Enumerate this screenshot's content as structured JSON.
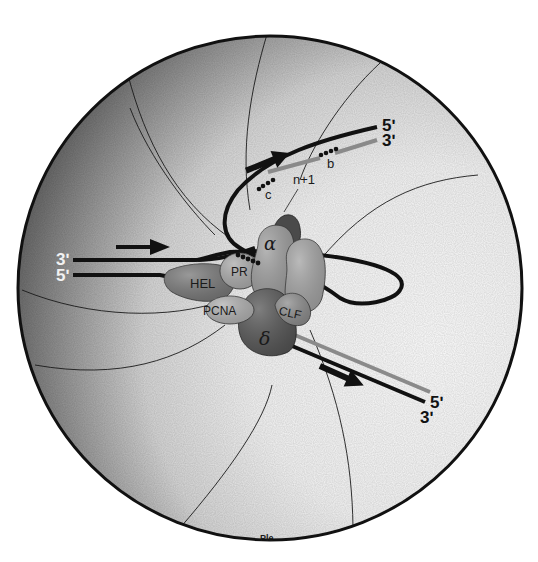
{
  "figure": {
    "type": "schematic diagram"
  },
  "labels": {
    "leading_in_3": "3ʹ",
    "leading_in_5": "5ʹ",
    "top_out_5": "5ʹ",
    "top_out_3": "3ʹ",
    "bottom_out_5": "5ʹ",
    "bottom_out_3": "3ʹ",
    "okazaki_b": "b",
    "okazaki_c": "c",
    "okazaki_next": "n+1",
    "bottom_pole": "Ple"
  },
  "proteins": [
    {
      "id": "hel",
      "label": "HEL",
      "fill": "#7a7a7a"
    },
    {
      "id": "pr",
      "label": "PR",
      "fill": "#a9a9a9"
    },
    {
      "id": "alpha",
      "label": "α",
      "fill": "#9c9c9c"
    },
    {
      "id": "alpha-partner",
      "label": "",
      "fill": "#a2a2a2"
    },
    {
      "id": "alpha-cap",
      "label": "",
      "fill": "#4a4a4a"
    },
    {
      "id": "pcna",
      "label": "PCNA",
      "fill": "#b0b0b0"
    },
    {
      "id": "delta",
      "label": "δ",
      "fill": "#555555"
    },
    {
      "id": "clf",
      "label": "CLF",
      "fill": "#8c8c8c"
    }
  ],
  "colors": {
    "outline": "#111111",
    "template_strand": "#111111",
    "new_strand": "#8a8a8a",
    "shade_dark": "#3c3c3c",
    "shade_light": "#f4f4f4"
  },
  "arrows": [
    {
      "id": "arrow-fork-direction",
      "direction": "right"
    },
    {
      "id": "arrow-lagging-direction",
      "direction": "up-right"
    },
    {
      "id": "arrow-leading-out",
      "direction": "down-right"
    }
  ]
}
